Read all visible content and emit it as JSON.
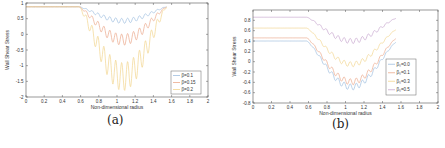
{
  "chart_data": [
    {
      "type": "line",
      "panel_label": "(a)",
      "title": "",
      "xlabel": "Non-dimensional radius",
      "ylabel": "Wall Shear Stress",
      "xlim": [
        0,
        2
      ],
      "ylim": [
        -2,
        1
      ],
      "xticks": [
        "0",
        "0.2",
        "0.4",
        "0.6",
        "0.8",
        "1",
        "1.2",
        "1.4",
        "1.6",
        "1.8",
        "2"
      ],
      "yticks": [
        "1",
        "0.5",
        "0",
        "-0.5",
        "-1",
        "-1.5",
        "-2"
      ],
      "grid": false,
      "legend_position": "lower right",
      "series": [
        {
          "name": "β=0.1",
          "color": "#9fbfe0",
          "baseline": 0.88,
          "min": 0.35,
          "oscillation_amp": 0.08
        },
        {
          "name": "β=0.15",
          "color": "#eba98c",
          "baseline": 0.88,
          "min": -0.35,
          "oscillation_amp": 0.18
        },
        {
          "name": "β=0.2",
          "color": "#f2d68f",
          "baseline": 0.88,
          "min": -1.8,
          "oscillation_amp": 0.45
        }
      ],
      "constriction_region": [
        0.58,
        1.55
      ]
    },
    {
      "type": "line",
      "panel_label": "(b)",
      "title": "",
      "xlabel": "Non-dimensional radius",
      "ylabel": "Wall Shear Stress",
      "xlim": [
        0,
        2
      ],
      "ylim": [
        -0.8,
        1.0
      ],
      "xticks": [
        "0",
        "0.2",
        "0.4",
        "0.6",
        "0.8",
        "1",
        "1.2",
        "1.4",
        "1.6",
        "1.8",
        "2"
      ],
      "yticks": [
        "0.8",
        "0.6",
        "0.4",
        "0.2",
        "0",
        "-0.2",
        "-0.4",
        "-0.6",
        "-0.8"
      ],
      "grid": false,
      "legend_position": "lower right",
      "series": [
        {
          "name": "β₀=0.0",
          "color": "#9fbfe0",
          "baseline": 0.4,
          "end_level": 0.38,
          "min": -0.55,
          "oscillation_amp": 0.06
        },
        {
          "name": "β₀=0.1",
          "color": "#eba98c",
          "baseline": 0.46,
          "end_level": 0.45,
          "min": -0.45,
          "oscillation_amp": 0.06
        },
        {
          "name": "β₀=0.3",
          "color": "#f2d68f",
          "baseline": 0.65,
          "end_level": 0.62,
          "min": -0.1,
          "oscillation_amp": 0.05
        },
        {
          "name": "β₀=0.5",
          "color": "#c7a6cf",
          "baseline": 0.86,
          "end_level": 0.84,
          "min": 0.35,
          "oscillation_amp": 0.05
        }
      ],
      "constriction_region": [
        0.58,
        1.55
      ]
    }
  ],
  "captions": {
    "a": "(a)",
    "b": "(b)"
  }
}
